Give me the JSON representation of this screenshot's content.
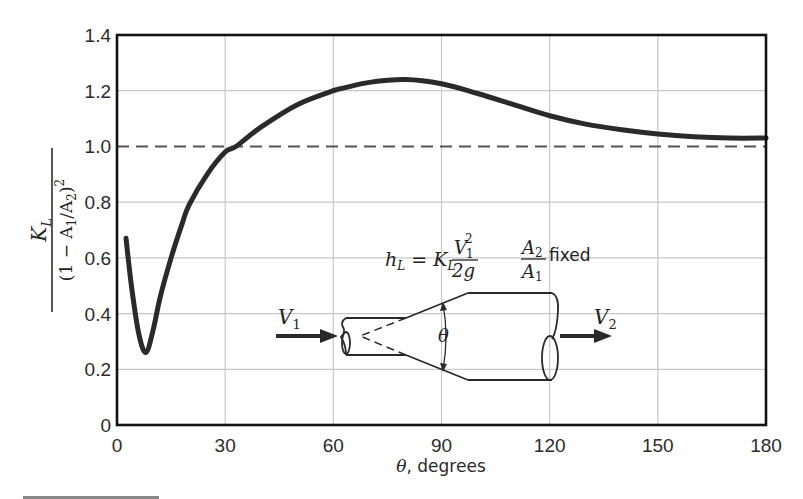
{
  "chart_data": {
    "type": "line",
    "title": "",
    "xlabel": "θ, degrees",
    "ylabel": "K_L / (1 − A1/A2)^2",
    "xlim": [
      0,
      180
    ],
    "ylim": [
      0,
      1.4
    ],
    "x_ticks": [
      0,
      30,
      60,
      90,
      120,
      150,
      180
    ],
    "y_ticks": [
      0,
      0.2,
      0.4,
      0.6,
      0.8,
      1.0,
      1.2,
      1.4
    ],
    "x_tick_labels": [
      "0",
      "30",
      "60",
      "90",
      "120",
      "150",
      "180"
    ],
    "y_tick_labels": [
      "0",
      "0.2",
      "0.4",
      "0.6",
      "0.8",
      "1.0",
      "1.2",
      "1.4"
    ],
    "grid": true,
    "legend": null,
    "series": [
      {
        "name": "K_L/(1-A1/A2)^2 vs θ",
        "style": "solid-thick",
        "x": [
          2.5,
          4,
          6,
          8,
          10,
          12,
          15,
          18,
          20,
          25,
          30,
          33,
          40,
          50,
          60,
          63,
          70,
          80,
          90,
          100,
          110,
          120,
          130,
          140,
          150,
          160,
          170,
          180
        ],
        "y": [
          0.67,
          0.5,
          0.33,
          0.26,
          0.34,
          0.46,
          0.6,
          0.72,
          0.79,
          0.9,
          0.98,
          1.0,
          1.07,
          1.15,
          1.2,
          1.21,
          1.23,
          1.24,
          1.225,
          1.19,
          1.15,
          1.11,
          1.08,
          1.06,
          1.045,
          1.035,
          1.03,
          1.03
        ]
      },
      {
        "name": "reference line",
        "style": "dashed",
        "x": [
          0,
          180
        ],
        "y": [
          1.0,
          1.0
        ]
      }
    ],
    "annotations": [
      "h_L = K_L V1^2/(2g)",
      "A2/A1 fixed",
      "V1",
      "V2",
      "θ"
    ]
  },
  "labels": {
    "x_axis_title": "θ, degrees",
    "y_axis_numerator": "K",
    "y_axis_numerator_sub": "L",
    "y_axis_denominator": "(1 − A",
    "y_axis_denominator_sub1": "1",
    "y_axis_denominator_mid": "/A",
    "y_axis_denominator_sub2": "2",
    "y_axis_denominator_end": ")",
    "y_axis_denominator_sup": "2"
  },
  "inset": {
    "formula_lhs": "h",
    "formula_lhs_sub": "L",
    "formula_eq": " = ",
    "formula_k": "K",
    "formula_k_sub": "L",
    "formula_num": "V",
    "formula_num_sub": "1",
    "formula_num_sup": "2",
    "formula_den": "2g",
    "ratio_num": "A",
    "ratio_num_sub": "2",
    "ratio_den": "A",
    "ratio_den_sub": "1",
    "ratio_text": "fixed",
    "v1_label": "V",
    "v1_sub": "1",
    "v2_label": "V",
    "v2_sub": "2",
    "theta_label": "θ"
  },
  "colors": {
    "curve": "#2a2a2a",
    "axes": "#111111",
    "grid": "#c8c8c8",
    "dashed": "#555555",
    "text": "#2b2b2b"
  }
}
